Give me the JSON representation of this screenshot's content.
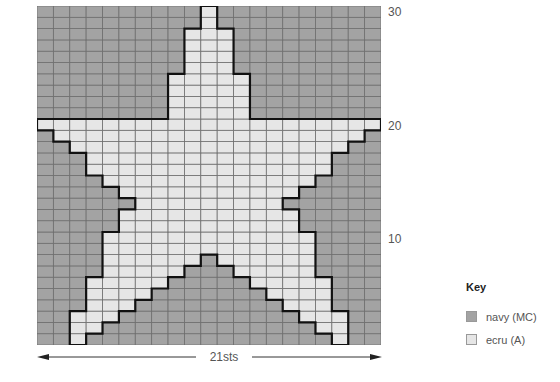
{
  "chart": {
    "columns": 21,
    "rows": 30,
    "colors": {
      "MC": "#a3a3a3",
      "A": "#e6e6e6",
      "grid": "#6e6e6e",
      "outline": "#111111"
    },
    "light_cells_by_row": {
      "30": [
        [
          10,
          10
        ]
      ],
      "29": [
        [
          10,
          10
        ]
      ],
      "28": [
        [
          9,
          11
        ]
      ],
      "27": [
        [
          9,
          11
        ]
      ],
      "26": [
        [
          9,
          11
        ]
      ],
      "25": [
        [
          9,
          11
        ]
      ],
      "24": [
        [
          8,
          12
        ]
      ],
      "23": [
        [
          8,
          12
        ]
      ],
      "22": [
        [
          8,
          12
        ]
      ],
      "21": [
        [
          8,
          12
        ]
      ],
      "20": [
        [
          0,
          20
        ]
      ],
      "19": [
        [
          1,
          19
        ]
      ],
      "18": [
        [
          2,
          18
        ]
      ],
      "17": [
        [
          3,
          17
        ]
      ],
      "16": [
        [
          3,
          17
        ]
      ],
      "15": [
        [
          4,
          16
        ]
      ],
      "14": [
        [
          5,
          15
        ]
      ],
      "13": [
        [
          6,
          14
        ]
      ],
      "12": [
        [
          5,
          15
        ]
      ],
      "11": [
        [
          5,
          15
        ]
      ],
      "10": [
        [
          4,
          16
        ]
      ],
      "9": [
        [
          4,
          16
        ]
      ],
      "8": [
        [
          4,
          9
        ],
        [
          11,
          16
        ]
      ],
      "7": [
        [
          4,
          8
        ],
        [
          12,
          16
        ]
      ],
      "6": [
        [
          3,
          7
        ],
        [
          13,
          17
        ]
      ],
      "5": [
        [
          3,
          6
        ],
        [
          14,
          17
        ]
      ],
      "4": [
        [
          3,
          5
        ],
        [
          15,
          17
        ]
      ],
      "3": [
        [
          2,
          4
        ],
        [
          16,
          18
        ]
      ],
      "2": [
        [
          2,
          3
        ],
        [
          17,
          18
        ]
      ],
      "1": [
        [
          2,
          2
        ],
        [
          18,
          18
        ]
      ]
    },
    "row_labels": [
      {
        "row": 30,
        "text": "30"
      },
      {
        "row": 20,
        "text": "20"
      },
      {
        "row": 10,
        "text": "10"
      }
    ],
    "width_label": "21sts"
  },
  "key": {
    "title": "Key",
    "items": [
      {
        "label": "navy (MC)",
        "color": "#a3a3a3"
      },
      {
        "label": "ecru (A)",
        "color": "#e6e6e6"
      }
    ]
  }
}
